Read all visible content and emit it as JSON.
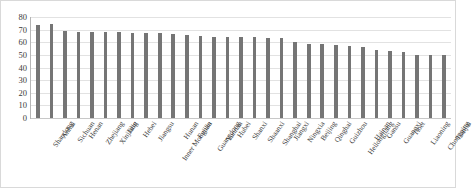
{
  "chart_data": {
    "type": "bar",
    "title": "",
    "subtitle": "",
    "xlabel": "",
    "ylabel": "",
    "ylim": [
      0,
      80
    ],
    "yticks": [
      0,
      10,
      20,
      30,
      40,
      50,
      60,
      70,
      80
    ],
    "grid": true,
    "legend": "none",
    "bar_color": "#757575",
    "gridline_color": "#e2e2e2",
    "categories": [
      "Shandong",
      "Anhui",
      "Sichuan",
      "Henan",
      "Zhejiang",
      "Xinjiang",
      "Jilin",
      "Hebei",
      "Jiangsu",
      "Inner Mongolia",
      "Hunan",
      "Fujian",
      "Guangdong",
      "Yunnan",
      "Hubei",
      "Shanxi",
      "Shaanxi",
      "Shanghai",
      "Jiangxi",
      "Ningxia",
      "Beijing",
      "Qinghai",
      "Guizhou",
      "Heilongjiang",
      "Hainan",
      "Gansu",
      "Guangxi",
      "Tibet",
      "Liaoning",
      "Chongqing",
      "Tianjin"
    ],
    "values": [
      74,
      74.5,
      69,
      68,
      68,
      68,
      68,
      67.5,
      67,
      67,
      66.5,
      66,
      65,
      64,
      64,
      64,
      64,
      63.5,
      63.5,
      60,
      59,
      59,
      58,
      57,
      56,
      54,
      53,
      52,
      50,
      50,
      50
    ]
  }
}
